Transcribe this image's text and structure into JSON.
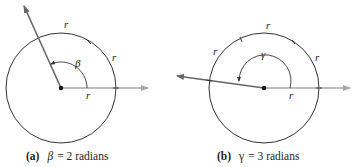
{
  "figure_a": {
    "arc_labels": [
      "r",
      "r",
      "r"
    ],
    "angle_symbol": "β",
    "caption": {
      "tag": "(a)",
      "symbol": "β",
      "text": " = 2 radians"
    }
  },
  "figure_b": {
    "arc_labels": [
      "r",
      "r",
      "r",
      "r"
    ],
    "angle_symbol": "γ",
    "caption": {
      "tag": "(b)",
      "symbol": "γ",
      "text": " = 3 radians"
    }
  },
  "colors": {
    "circle": "#333333",
    "ray_dark": "#555555",
    "ray_light": "#a8a8a8"
  }
}
